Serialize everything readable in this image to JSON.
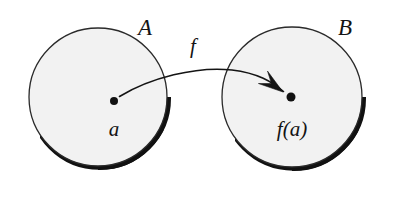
{
  "figure": {
    "type": "set-function-mapping-diagram",
    "caption_text": "",
    "background_color": "#ffffff",
    "ink_color": "#141414",
    "disk_fill_color": "#f2f2f2",
    "shadow_color": "#111111"
  },
  "sets": [
    {
      "id": "domain",
      "label": "A",
      "label_x": 145,
      "label_y": 35,
      "center_x": 98,
      "center_y": 97,
      "radius": 69
    },
    {
      "id": "codomain",
      "label": "B",
      "label_x": 345,
      "label_y": 35,
      "center_x": 292,
      "center_y": 97,
      "radius": 70
    }
  ],
  "elements": [
    {
      "id": "element-a",
      "label": "a",
      "dot_x": 114,
      "dot_y": 101,
      "dot_radius": 4,
      "label_x": 114,
      "label_y": 136
    },
    {
      "id": "element-fa",
      "label": "f(a)",
      "dot_x": 291,
      "dot_y": 97,
      "dot_radius": 4.5,
      "label_x": 292,
      "label_y": 136
    }
  ],
  "mapping": {
    "id": "function-arrow",
    "label": "f",
    "label_x": 193,
    "label_y": 53,
    "path": "M 119.5 96.5 C 150 78 196 66 232 70 C 258 73 272 82 283.5 91.5",
    "arrowhead_tip_x": 283,
    "arrowhead_tip_y": 92,
    "stroke_width": 1.6
  }
}
